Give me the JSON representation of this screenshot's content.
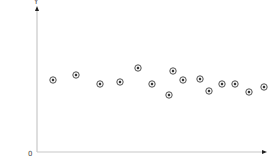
{
  "chart_data": {
    "type": "scatter",
    "title": "",
    "xlabel": "",
    "ylabel": "Y",
    "origin_label": "0",
    "grid": false,
    "legend": null,
    "axis_color": "#c8c8c8",
    "marker_color": "#555555",
    "marker_style": "circle-with-center-dot",
    "pixel_points": [
      {
        "x": 53,
        "y": 80
      },
      {
        "x": 76,
        "y": 75
      },
      {
        "x": 100,
        "y": 84
      },
      {
        "x": 120,
        "y": 82
      },
      {
        "x": 138,
        "y": 68
      },
      {
        "x": 152,
        "y": 84
      },
      {
        "x": 169,
        "y": 95
      },
      {
        "x": 173,
        "y": 71
      },
      {
        "x": 183,
        "y": 80
      },
      {
        "x": 200,
        "y": 79
      },
      {
        "x": 209,
        "y": 91
      },
      {
        "x": 222,
        "y": 84
      },
      {
        "x": 235,
        "y": 84
      },
      {
        "x": 249,
        "y": 92
      },
      {
        "x": 264,
        "y": 87
      }
    ],
    "x": [
      1,
      2,
      3,
      4,
      5,
      6,
      7,
      7.2,
      8,
      9,
      9.5,
      10,
      11,
      12,
      13
    ],
    "y": [
      0.5,
      0.53,
      0.47,
      0.48,
      0.57,
      0.47,
      0.4,
      0.55,
      0.5,
      0.5,
      0.43,
      0.47,
      0.47,
      0.42,
      0.45
    ],
    "xlim": [
      0,
      14
    ],
    "ylim": [
      0,
      1
    ]
  }
}
